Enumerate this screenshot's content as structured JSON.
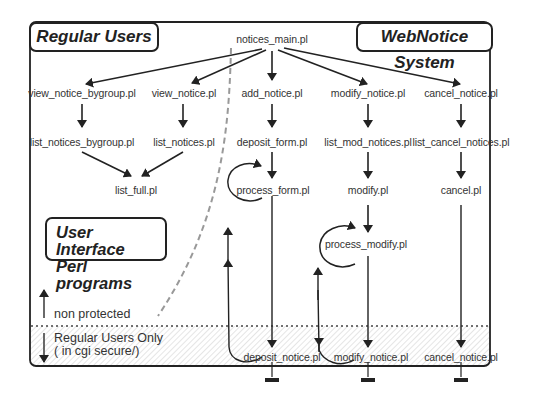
{
  "titles": {
    "regular_users": "Regular Users",
    "webnotice_system": "WebNotice System",
    "ui_perl_line1": "User Interface",
    "ui_perl_line2": "Perl programs"
  },
  "legend": {
    "non_protected": "non protected",
    "regular_only_line1": "Regular Users Only",
    "regular_only_line2": "( in cgi secure/)"
  },
  "nodes": {
    "notices_main": "notices_main.pl",
    "view_notice_bygroup": "view_notice_bygroup.pl",
    "view_notice": "view_notice.pl",
    "add_notice": "add_notice.pl",
    "modify_notice": "modify_notice.pl",
    "cancel_notice": "cancel_notice.pl",
    "list_notices_bygroup": "list_notices_bygroup.pl",
    "list_notices": "list_notices.pl",
    "deposit_form": "deposit_form.pl",
    "list_mod_notices": "list_mod_notices.pl",
    "list_cancel_notices": "list_cancel_notices.pl",
    "list_full": "list_full.pl",
    "process_form": "process_form.pl",
    "modify": "modify.pl",
    "cancel": "cancel.pl",
    "process_modify": "process_modify.pl",
    "deposit_notice": "deposit_notice.pl",
    "modify_notice_secure": "modify_notice.pl",
    "cancel_notice_secure": "cancel_notice.pl"
  },
  "colors": {
    "line": "#222222",
    "text": "#333333",
    "dashed_boundary": "#888888",
    "hatch": "#d8d8d8"
  }
}
